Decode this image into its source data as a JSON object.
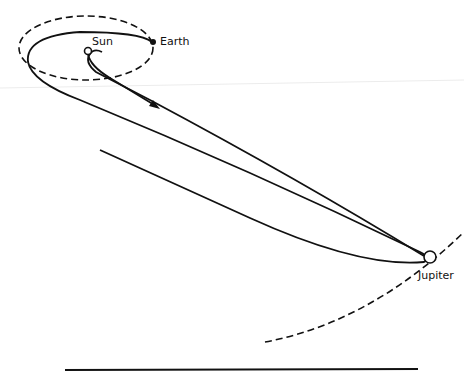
{
  "diagram": {
    "labels": {
      "sun": "Sun",
      "earth": "Earth",
      "jupiter": "Jupiter"
    },
    "colors": {
      "ink": "#111111",
      "background": "#ffffff",
      "faint_line": "#e6e6e6"
    }
  }
}
